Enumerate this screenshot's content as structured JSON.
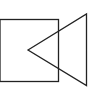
{
  "figure": {
    "stroke_color": "#222222",
    "background": "#ffffff",
    "stroke_width": 1.3,
    "shapes": {
      "rectangle": {
        "x": 0,
        "y": 19.5,
        "width": 58.5,
        "height": 62
      },
      "triangle": {
        "points": "28,50 86.5,14 86.5,85.5"
      }
    }
  }
}
